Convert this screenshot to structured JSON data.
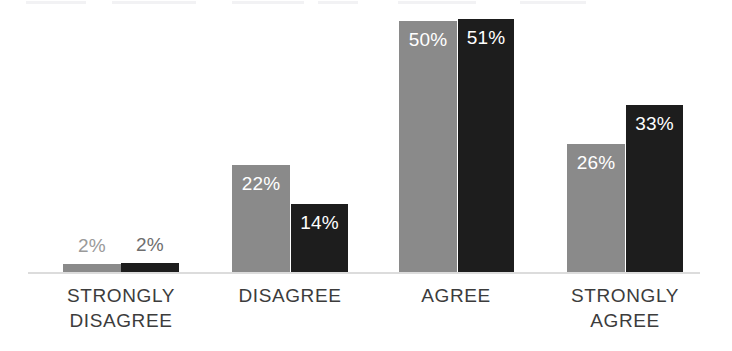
{
  "chart_data": {
    "type": "bar",
    "title": "",
    "subtitle": "",
    "xlabel": "",
    "ylabel": "",
    "ylim": [
      0,
      60
    ],
    "grid": false,
    "legend_position": "none",
    "orientation": "vertical",
    "grouping": "grouped",
    "value_suffix": "%",
    "categories": [
      "STRONGLY\nDISAGREE",
      "DISAGREE",
      "AGREE",
      "STRONGLY\nAGREE"
    ],
    "series": [
      {
        "name": "Series 1",
        "color": "#8a8a8a",
        "values": [
          2,
          22,
          50,
          26
        ],
        "labels": [
          "2%",
          "22%",
          "50%",
          "26%"
        ]
      },
      {
        "name": "Series 2",
        "color": "#1d1d1d",
        "values": [
          2,
          14,
          51,
          33
        ],
        "labels": [
          "2%",
          "14%",
          "51%",
          "33%"
        ]
      }
    ],
    "annotations": []
  },
  "axis": {
    "baseline_color": "#dcdcdc"
  },
  "colors": {
    "series_a": "#8a8a8a",
    "series_b": "#1d1d1d",
    "background": "#ffffff",
    "label_text": "#3c3c3c",
    "value_text_inside": "#ffffff",
    "value_text_outside": "#9a9a9a"
  },
  "bars": [
    {
      "group": 0,
      "series": 0,
      "label": "2%",
      "x": 63,
      "width": 58,
      "top": 264,
      "height": 8,
      "label_placement": "outside",
      "label_tone": "light"
    },
    {
      "group": 0,
      "series": 1,
      "label": "2%",
      "x": 121,
      "width": 58,
      "top": 263,
      "height": 9,
      "label_placement": "outside",
      "label_tone": "dark"
    },
    {
      "group": 1,
      "series": 0,
      "label": "22%",
      "x": 232,
      "width": 58,
      "top": 165,
      "height": 107,
      "label_placement": "inside",
      "label_tone": "light"
    },
    {
      "group": 1,
      "series": 1,
      "label": "14%",
      "x": 291,
      "width": 57,
      "top": 204,
      "height": 68,
      "label_placement": "inside",
      "label_tone": "light"
    },
    {
      "group": 2,
      "series": 0,
      "label": "50%",
      "x": 399,
      "width": 58,
      "top": 21,
      "height": 251,
      "label_placement": "inside",
      "label_tone": "light"
    },
    {
      "group": 2,
      "series": 1,
      "label": "51%",
      "x": 458,
      "width": 56,
      "top": 19,
      "height": 253,
      "label_placement": "inside",
      "label_tone": "light"
    },
    {
      "group": 3,
      "series": 0,
      "label": "26%",
      "x": 567,
      "width": 58,
      "top": 144,
      "height": 128,
      "label_placement": "inside",
      "label_tone": "light"
    },
    {
      "group": 3,
      "series": 1,
      "label": "33%",
      "x": 626,
      "width": 57,
      "top": 105,
      "height": 167,
      "label_placement": "inside",
      "label_tone": "light"
    }
  ],
  "category_labels": [
    {
      "text": "STRONGLY\nDISAGREE",
      "x": 31,
      "width": 180
    },
    {
      "text": "DISAGREE",
      "x": 200,
      "width": 180
    },
    {
      "text": "AGREE",
      "x": 366,
      "width": 180
    },
    {
      "text": "STRONGLY\nAGREE",
      "x": 535,
      "width": 180
    }
  ],
  "scan_artifacts": [
    {
      "x": 26,
      "width": 60
    },
    {
      "x": 112,
      "width": 84
    },
    {
      "x": 232,
      "width": 72
    },
    {
      "x": 318,
      "width": 40
    },
    {
      "x": 398,
      "width": 78
    },
    {
      "x": 520,
      "width": 66
    }
  ]
}
